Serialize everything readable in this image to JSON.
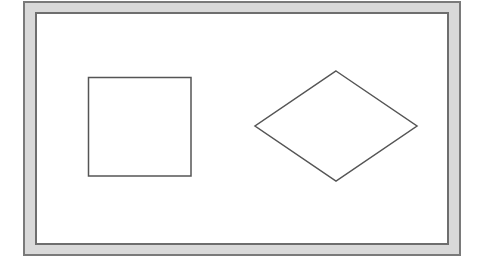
{
  "diagram": {
    "frame": {
      "border_color": "#7a7a7a",
      "fill": "#d9d9d9"
    },
    "canvas": {
      "border_color": "#6e6e6e",
      "fill": "#ffffff"
    },
    "shapes": [
      {
        "type": "square",
        "x": 88,
        "y": 77,
        "width": 103,
        "height": 99,
        "stroke": "#555555"
      },
      {
        "type": "diamond",
        "points": "336,71 417,126 336,181 255,126",
        "stroke": "#555555"
      }
    ]
  }
}
